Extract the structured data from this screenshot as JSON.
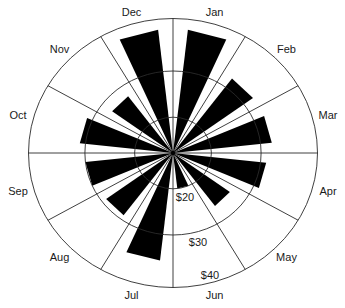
{
  "chart_data": {
    "type": "polar-bar",
    "title": "",
    "categories": [
      "Jan",
      "Feb",
      "Mar",
      "Apr",
      "May",
      "Jun",
      "Jul",
      "Aug",
      "Sep",
      "Oct",
      "Nov",
      "Dec"
    ],
    "values": [
      38,
      32,
      32,
      31,
      26.5,
      20,
      35,
      29,
      30,
      31,
      27.5,
      38
    ],
    "radial_axis": {
      "tick_labels": [
        "$20",
        "$30",
        "$40"
      ],
      "tick_values": [
        20,
        30,
        40
      ],
      "range": [
        12,
        40
      ],
      "unit": "$"
    },
    "angular_axis": {
      "start": "top",
      "direction": "clockwise",
      "sectors": 12
    },
    "grid": true,
    "legend": "none",
    "colors": {
      "bar": "#000000",
      "grid": "#2a2a2a",
      "background": "#ffffff",
      "text": "#1a1a1a"
    }
  }
}
